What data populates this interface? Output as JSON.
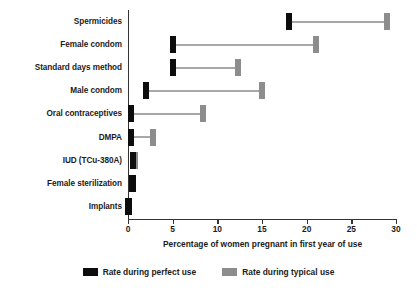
{
  "chart_data": {
    "type": "bar",
    "title": "",
    "xlabel": "Percentage of women pregnant in first year of use",
    "ylabel": "",
    "xlim": [
      0,
      30
    ],
    "xticks": [
      0,
      5,
      10,
      15,
      20,
      25,
      30
    ],
    "xtick_labels": [
      "0",
      "5",
      "10",
      "15",
      "20",
      "25",
      "30"
    ],
    "grid": false,
    "legend_position": "bottom-center",
    "orientation": "horizontal",
    "categories": [
      "Spermicides",
      "Female condom",
      "Standard days method",
      "Male condom",
      "Oral contraceptives",
      "DMPA",
      "IUD (TCu-380A)",
      "Female sterilization",
      "Implants"
    ],
    "series": [
      {
        "name": "Rate during perfect use",
        "color": "#0d0d0d",
        "values": [
          18,
          5,
          5,
          2,
          0.3,
          0.3,
          0.6,
          0.5,
          0.05
        ]
      },
      {
        "name": "Rate during typical use",
        "color": "#8d8d8d",
        "values": [
          29,
          21,
          12.3,
          15,
          8.4,
          2.8,
          0.8,
          0.5,
          0.05
        ]
      }
    ]
  },
  "legend": {
    "entries": [
      {
        "label": "Rate during perfect use",
        "key": "perfect"
      },
      {
        "label": "Rate during typical use",
        "key": "typical"
      }
    ]
  }
}
